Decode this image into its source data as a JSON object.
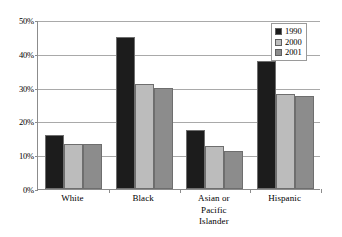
{
  "chart_data": {
    "type": "bar",
    "title": "",
    "xlabel": "",
    "ylabel": "",
    "categories": [
      "White",
      "Black",
      "Asian or Pacific Islander",
      "Hispanic"
    ],
    "category_lines": [
      [
        "White"
      ],
      [
        "Black"
      ],
      [
        "Asian or",
        "Pacific",
        "Islander"
      ],
      [
        "Hispanic"
      ]
    ],
    "series": [
      {
        "name": "1990",
        "color": "#1c1c1c",
        "values": [
          16.0,
          45.0,
          17.5,
          38.0
        ]
      },
      {
        "name": "2000",
        "color": "#bcbcbc",
        "values": [
          13.2,
          31.0,
          12.6,
          28.0
        ]
      },
      {
        "name": "2001",
        "color": "#8c8c8c",
        "values": [
          13.4,
          30.0,
          11.3,
          27.5
        ]
      }
    ],
    "ylim": [
      0,
      50
    ],
    "ytick_values": [
      0,
      10,
      20,
      30,
      40,
      50
    ],
    "ytick_labels": [
      "0%",
      "10%",
      "20%",
      "30%",
      "40%",
      "50%"
    ],
    "grid": "horizontal",
    "legend_position": "top-right",
    "legend_entries": [
      "1990",
      "2000",
      "2001"
    ],
    "colors": {
      "axis": "#8c8c8c",
      "gridline": "#a9a9a9",
      "bar_outline": "#6e6e6e",
      "background": "#ffffff",
      "text": "#000000"
    }
  }
}
